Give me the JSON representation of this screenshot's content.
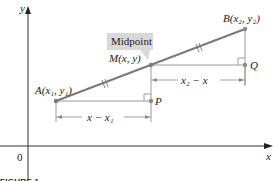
{
  "figure": {
    "caption": "FIGURE 1",
    "axes": {
      "x_label": "x",
      "y_label": "y",
      "origin_label": "0"
    },
    "callout": {
      "text": "Midpoint"
    },
    "points": {
      "A": {
        "label": "A(x₁, y₁)"
      },
      "M": {
        "label": "M(x, y)"
      },
      "B": {
        "label": "B(x₂, y₂)"
      },
      "P": {
        "label": "P"
      },
      "Q": {
        "label": "Q"
      }
    },
    "dimensions": {
      "lower": "x − x₁",
      "upper": "x₂ − x"
    },
    "colors": {
      "segment": "#7a7a7a",
      "axis": "#333333",
      "guide": "#9a9a9a",
      "callout_bg": "#d9d9d9",
      "point": "#8a8a8a"
    }
  }
}
